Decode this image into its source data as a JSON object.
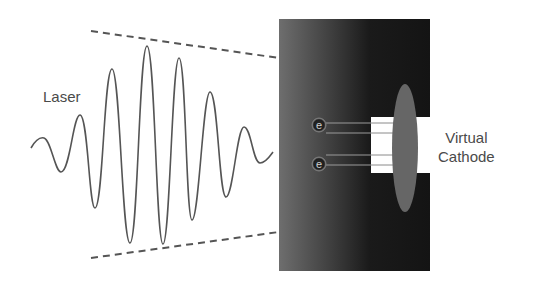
{
  "labels": {
    "laser": "Laser",
    "virtual_cathode_line1": "Virtual",
    "virtual_cathode_line2": "Cathode"
  },
  "electrons": [
    {
      "symbol": "e",
      "cx": 319,
      "cy": 125
    },
    {
      "symbol": "e",
      "cx": 319,
      "cy": 164
    }
  ],
  "colors": {
    "wave": "#555555",
    "envelope_dash": "#555555",
    "target_light": "#6e6e6e",
    "target_dark": "#141414",
    "virtual_cathode": "#666666",
    "slot": "#ffffff",
    "label_text": "#4a4a4a"
  },
  "wave_points": [
    [
      31,
      148
    ],
    [
      44,
      138
    ],
    [
      61,
      172
    ],
    [
      80,
      115
    ],
    [
      95,
      208
    ],
    [
      112,
      69
    ],
    [
      130,
      243
    ],
    [
      147,
      46
    ],
    [
      163,
      244
    ],
    [
      179,
      58
    ],
    [
      192,
      220
    ],
    [
      210,
      92
    ],
    [
      226,
      197
    ],
    [
      244,
      127
    ],
    [
      260,
      163
    ],
    [
      273,
      152
    ]
  ],
  "envelope": {
    "top": {
      "x1": 91,
      "y1": 31,
      "x2": 279,
      "y2": 58
    },
    "bottom": {
      "x1": 91,
      "y1": 258,
      "x2": 279,
      "y2": 232
    }
  }
}
